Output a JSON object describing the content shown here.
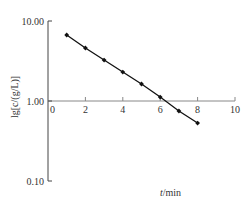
{
  "chart_data": {
    "type": "line",
    "title": "",
    "xlabel": "t/min",
    "ylabel": "lg[c/(g/L)]",
    "yscale": "log",
    "xlim": [
      0,
      10
    ],
    "ylim": [
      0.1,
      10
    ],
    "x_ticks": [
      0,
      2,
      4,
      6,
      8,
      10
    ],
    "x_tick_labels": [
      "0",
      "2",
      "4",
      "6",
      "8",
      "10"
    ],
    "y_ticks": [
      10,
      1,
      0.1
    ],
    "y_tick_labels": [
      "10.00",
      "1.00",
      "0.10"
    ],
    "grid": false,
    "legend": null,
    "series": [
      {
        "name": "c",
        "x": [
          1,
          2,
          3,
          4,
          5,
          6,
          7,
          8
        ],
        "values": [
          6.68,
          4.6,
          3.25,
          2.3,
          1.63,
          1.12,
          0.75,
          0.53
        ],
        "marker": "diamond",
        "color": "#111111"
      }
    ]
  },
  "axes": {
    "xlabel": "t/min",
    "ylabel": "lg[c/(g/L)]"
  }
}
